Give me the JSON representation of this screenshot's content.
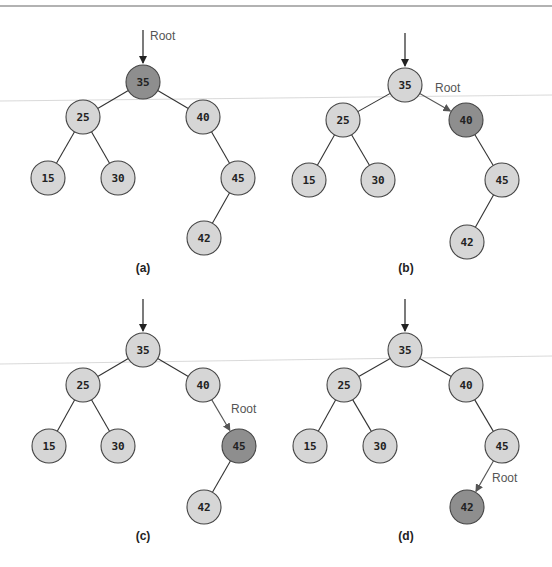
{
  "figure": {
    "top_rule": true,
    "colors": {
      "node_fill": "#d6d6d6",
      "node_highlight_fill": "#8e8e8e",
      "node_stroke": "#444444",
      "edge": "#333333",
      "root_arrow_gray": "#555555",
      "root_label": "#555555"
    },
    "root_label": "Root",
    "panels": [
      {
        "caption": "(a)",
        "caption_pos": [
          143,
          272
        ],
        "highlight": "35",
        "root_label_pos": [
          150,
          40
        ],
        "top_arrow": {
          "x": 143,
          "y1": 30,
          "y2": 63
        },
        "root_arrow": null,
        "nodes": [
          {
            "key": "35",
            "x": 143,
            "y": 82
          },
          {
            "key": "25",
            "x": 83,
            "y": 117
          },
          {
            "key": "40",
            "x": 203,
            "y": 117
          },
          {
            "key": "15",
            "x": 48,
            "y": 178
          },
          {
            "key": "30",
            "x": 118,
            "y": 178
          },
          {
            "key": "45",
            "x": 238,
            "y": 178
          },
          {
            "key": "42",
            "x": 204,
            "y": 238
          }
        ],
        "edges": [
          [
            "35",
            "25"
          ],
          [
            "35",
            "40"
          ],
          [
            "25",
            "15"
          ],
          [
            "25",
            "30"
          ],
          [
            "40",
            "45"
          ],
          [
            "45",
            "42"
          ]
        ]
      },
      {
        "caption": "(b)",
        "caption_pos": [
          406,
          272
        ],
        "highlight": "40",
        "root_label_pos": [
          435,
          92
        ],
        "top_arrow": {
          "x": 405,
          "y1": 33,
          "y2": 66
        },
        "root_arrow": [
          "35",
          "40"
        ],
        "nodes": [
          {
            "key": "35",
            "x": 405,
            "y": 85
          },
          {
            "key": "25",
            "x": 343,
            "y": 120
          },
          {
            "key": "40",
            "x": 466,
            "y": 120
          },
          {
            "key": "15",
            "x": 309,
            "y": 180
          },
          {
            "key": "30",
            "x": 378,
            "y": 180
          },
          {
            "key": "45",
            "x": 502,
            "y": 180
          },
          {
            "key": "42",
            "x": 467,
            "y": 242
          }
        ],
        "edges": [
          [
            "35",
            "25"
          ],
          [
            "35",
            "40"
          ],
          [
            "25",
            "15"
          ],
          [
            "25",
            "30"
          ],
          [
            "40",
            "45"
          ],
          [
            "45",
            "42"
          ]
        ]
      },
      {
        "caption": "(c)",
        "caption_pos": [
          143,
          540
        ],
        "highlight": "45",
        "root_label_pos": [
          231,
          413
        ],
        "top_arrow": {
          "x": 143,
          "y1": 299,
          "y2": 331
        },
        "root_arrow": [
          "40",
          "45"
        ],
        "nodes": [
          {
            "key": "35",
            "x": 143,
            "y": 350
          },
          {
            "key": "25",
            "x": 83,
            "y": 385
          },
          {
            "key": "40",
            "x": 203,
            "y": 385
          },
          {
            "key": "15",
            "x": 49,
            "y": 446
          },
          {
            "key": "30",
            "x": 118,
            "y": 446
          },
          {
            "key": "45",
            "x": 239,
            "y": 446
          },
          {
            "key": "42",
            "x": 204,
            "y": 507
          }
        ],
        "edges": [
          [
            "35",
            "25"
          ],
          [
            "35",
            "40"
          ],
          [
            "25",
            "15"
          ],
          [
            "25",
            "30"
          ],
          [
            "40",
            "45"
          ],
          [
            "45",
            "42"
          ]
        ]
      },
      {
        "caption": "(d)",
        "caption_pos": [
          406,
          540
        ],
        "highlight": "42",
        "root_label_pos": [
          492,
          482
        ],
        "top_arrow": {
          "x": 405,
          "y1": 299,
          "y2": 331
        },
        "root_arrow": [
          "45",
          "42"
        ],
        "nodes": [
          {
            "key": "35",
            "x": 405,
            "y": 350
          },
          {
            "key": "25",
            "x": 344,
            "y": 385
          },
          {
            "key": "40",
            "x": 466,
            "y": 385
          },
          {
            "key": "15",
            "x": 310,
            "y": 446
          },
          {
            "key": "30",
            "x": 380,
            "y": 446
          },
          {
            "key": "45",
            "x": 502,
            "y": 446
          },
          {
            "key": "42",
            "x": 467,
            "y": 507
          }
        ],
        "edges": [
          [
            "35",
            "25"
          ],
          [
            "35",
            "40"
          ],
          [
            "25",
            "15"
          ],
          [
            "25",
            "30"
          ],
          [
            "40",
            "45"
          ],
          [
            "45",
            "42"
          ]
        ]
      }
    ]
  }
}
